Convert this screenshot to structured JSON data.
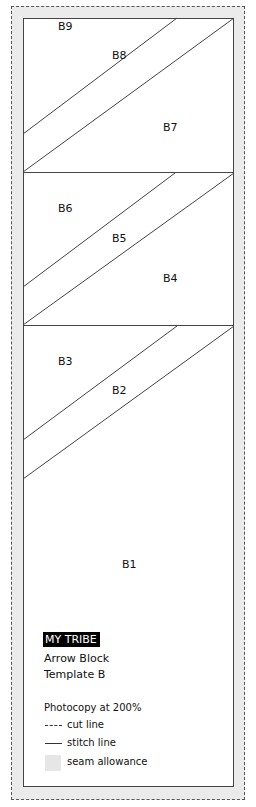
{
  "template": {
    "brand": "MY TRIBE",
    "title_line1": "Arrow Block",
    "title_line2": "Template B",
    "instruction": "Photocopy at 200%",
    "colors": {
      "seam_allowance": "#ebebeb",
      "stitch_line": "#444444",
      "cut_line": "#555555",
      "badge_bg": "#000000",
      "badge_text": "#ffffff"
    }
  },
  "legend": {
    "cut_line": "cut line",
    "stitch_line": "stitch line",
    "seam_allowance": "seam allowance"
  },
  "pieces": [
    {
      "id": "B9",
      "label": "B9"
    },
    {
      "id": "B8",
      "label": "B8"
    },
    {
      "id": "B7",
      "label": "B7"
    },
    {
      "id": "B6",
      "label": "B6"
    },
    {
      "id": "B5",
      "label": "B5"
    },
    {
      "id": "B4",
      "label": "B4"
    },
    {
      "id": "B3",
      "label": "B3"
    },
    {
      "id": "B2",
      "label": "B2"
    },
    {
      "id": "B1",
      "label": "B1"
    }
  ]
}
